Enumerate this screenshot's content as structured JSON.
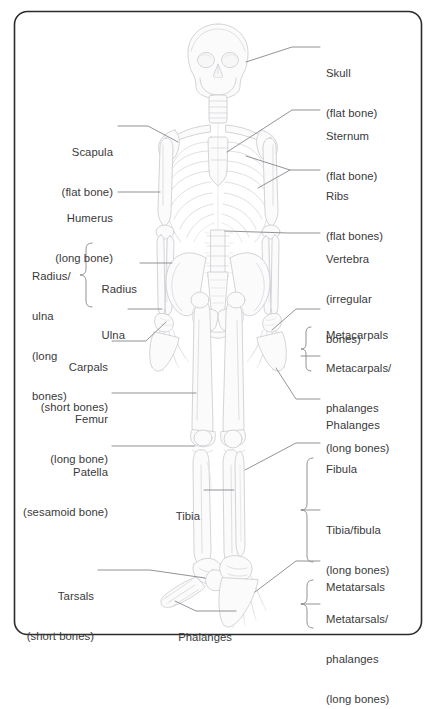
{
  "figure": {
    "type": "anatomical-diagram",
    "border_color": "#2b2b2b",
    "bone_fill": "#fbfbfb",
    "bone_stroke": "#c8c8ce",
    "leader_color": "#7d7d83",
    "text_color": "#3a3a3a",
    "background": "#ffffff"
  },
  "labels": {
    "skull": {
      "name": "Skull",
      "note": "(flat bone)"
    },
    "sternum": {
      "name": "Sternum",
      "note": "(flat bone)"
    },
    "ribs": {
      "name": "Ribs",
      "note": "(flat bones)"
    },
    "vertebra": {
      "name": "Vertebra",
      "note_1": "(irregular",
      "note_2": "bones)"
    },
    "scapula": {
      "name": "Scapula",
      "note": "(flat bone)"
    },
    "humerus": {
      "name": "Humerus",
      "note": "(long bone)"
    },
    "radius": {
      "name": "Radius"
    },
    "ulna": {
      "name": "Ulna"
    },
    "radius_ulna_group": {
      "line_1": "Radius/",
      "line_2": "ulna",
      "line_3": "(long",
      "line_4": "bones)"
    },
    "carpals": {
      "name": "Carpals",
      "note": "(short bones)"
    },
    "metacarpals": {
      "name": "Metacarpals"
    },
    "phalanges_hand": {
      "name": "Phalanges"
    },
    "metacarpals_phalanges_group": {
      "line_1": "Metacarpals/",
      "line_2": "phalanges",
      "line_3": "(long bones)"
    },
    "femur": {
      "name": "Femur",
      "note": "(long bone)"
    },
    "patella": {
      "name": "Patella",
      "note": "(sesamoid bone)"
    },
    "fibula": {
      "name": "Fibula"
    },
    "tibia": {
      "name": "Tibia"
    },
    "tibia_fibula_group": {
      "line_1": "Tibia/fibula",
      "line_2": "(long bones)"
    },
    "tarsals": {
      "name": "Tarsals",
      "note": "(short bones)"
    },
    "metatarsals": {
      "name": "Metatarsals"
    },
    "phalanges_foot": {
      "name": "Phalanges"
    },
    "metatarsals_phalanges_group": {
      "line_1": "Metatarsals/",
      "line_2": "phalanges",
      "line_3": "(long bones)"
    }
  }
}
